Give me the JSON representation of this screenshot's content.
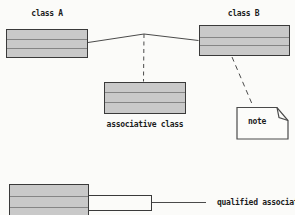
{
  "diagram_type": "uml-booch-notation",
  "labels": {
    "class_a": "class A",
    "class_b": "class B",
    "associative_class": "associative class",
    "note": "note",
    "qualified_association": "qualified association"
  },
  "colors": {
    "background": "#fbfbf9",
    "box_fill": "#c9c9c9",
    "box_border": "#3a3a3a",
    "compartment_divider": "#858585",
    "line": "#4a4a4a",
    "note_fill": "#fcfcfa",
    "text": "#1c1c1c"
  },
  "structure": {
    "class_a_compartments": 3,
    "class_b_compartments": 3,
    "associative_class_compartments": 3,
    "qualified_class_compartments": 3,
    "association": "class A — class B",
    "dashed_links": [
      "association — associative class",
      "class B — note"
    ]
  }
}
